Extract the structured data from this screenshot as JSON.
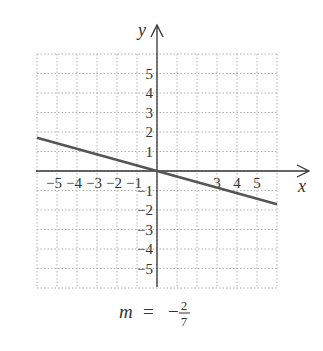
{
  "chart_data": {
    "type": "line",
    "title": "",
    "xlabel": "x",
    "ylabel": "y",
    "xlim": [
      -6,
      6
    ],
    "ylim": [
      -6,
      6
    ],
    "grid": true,
    "grid_style": "dotted",
    "x_ticks": [
      -5,
      -4,
      -3,
      -2,
      -1,
      3,
      4,
      5
    ],
    "x_tick_labels": [
      "−5",
      "−4",
      "−3",
      "−2",
      "−1",
      "3",
      "4",
      "5"
    ],
    "y_ticks": [
      5,
      4,
      3,
      2,
      1,
      -1,
      -2,
      -3,
      -4,
      -5
    ],
    "y_tick_labels": [
      "5",
      "4",
      "3",
      "2",
      "1",
      "−1",
      "−2",
      "−3",
      "−4",
      "−5"
    ],
    "series": [
      {
        "name": "y = -2/7 x",
        "slope": -0.2857,
        "intercept": 0,
        "x": [
          -6,
          6
        ],
        "y": [
          1.71,
          -1.71
        ],
        "color": "#555555"
      }
    ],
    "annotation": {
      "var": "m",
      "equals": "=",
      "sign": "−",
      "numerator": "2",
      "denominator": "7"
    }
  },
  "colors": {
    "axis": "#333333",
    "grid": "#b0b0b0",
    "line": "#555555"
  }
}
